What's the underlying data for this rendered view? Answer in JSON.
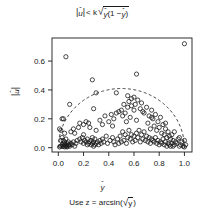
{
  "chart_data": {
    "type": "scatter",
    "title_parts": {
      "lhs_base": "u",
      "lhs_hat": "ˆ",
      "relation": "< k",
      "radical": "√",
      "inner_base_1": "y",
      "inner_hat_1": "ˆ",
      "inner_mid": "(1 −",
      "inner_base_2": "y",
      "inner_hat_2": "ˆ",
      "inner_close": ")"
    },
    "xlabel": "ŷ",
    "xlabel_base": "y",
    "xlabel_hat": "ˆ",
    "sublabel": "Use z = arcsin(√y̅)",
    "sublabel_parts": {
      "prefix": "Use z = arcsin(",
      "radical": "√",
      "arg": "y",
      "suffix": ")"
    },
    "ylabel": "|û|",
    "ylabel_base": "u",
    "ylabel_hat": "ˆ",
    "xticks": [
      "0.0",
      "0.2",
      "0.4",
      "0.6",
      "0.8",
      "1.0"
    ],
    "xtick_values": [
      0.0,
      0.2,
      0.4,
      0.6,
      0.8,
      1.0
    ],
    "yticks": [
      "0.0",
      "0.2",
      "0.4",
      "0.6"
    ],
    "ytick_values": [
      0.0,
      0.2,
      0.4,
      0.6
    ],
    "xlim": [
      -0.05,
      1.06
    ],
    "ylim": [
      -0.03,
      0.76
    ],
    "grid": false,
    "legend": false,
    "marker": "open-circle",
    "marker_color": "#1a1a1a",
    "marker_radius": 2.1,
    "boundary_curve": {
      "label": "k√(ŷ(1 − ŷ))",
      "style": "dashed",
      "k": 0.82,
      "peak_x": 0.5,
      "peak_y": 0.41
    },
    "x": [
      0.01,
      0.01,
      0.02,
      0.02,
      0.02,
      0.03,
      0.03,
      0.03,
      0.03,
      0.04,
      0.04,
      0.04,
      0.05,
      0.05,
      0.05,
      0.05,
      0.06,
      0.06,
      0.06,
      0.07,
      0.07,
      0.07,
      0.08,
      0.08,
      0.09,
      0.09,
      0.1,
      0.1,
      0.11,
      0.12,
      0.13,
      0.13,
      0.14,
      0.15,
      0.16,
      0.17,
      0.17,
      0.18,
      0.19,
      0.2,
      0.2,
      0.21,
      0.22,
      0.22,
      0.23,
      0.23,
      0.24,
      0.24,
      0.25,
      0.25,
      0.26,
      0.26,
      0.27,
      0.27,
      0.28,
      0.28,
      0.29,
      0.29,
      0.3,
      0.3,
      0.31,
      0.32,
      0.33,
      0.34,
      0.35,
      0.36,
      0.37,
      0.38,
      0.39,
      0.4,
      0.41,
      0.42,
      0.43,
      0.44,
      0.44,
      0.45,
      0.46,
      0.47,
      0.48,
      0.48,
      0.49,
      0.5,
      0.5,
      0.51,
      0.51,
      0.52,
      0.52,
      0.53,
      0.53,
      0.54,
      0.54,
      0.55,
      0.55,
      0.56,
      0.56,
      0.57,
      0.57,
      0.58,
      0.58,
      0.59,
      0.6,
      0.6,
      0.61,
      0.61,
      0.62,
      0.62,
      0.63,
      0.63,
      0.64,
      0.65,
      0.65,
      0.66,
      0.66,
      0.67,
      0.68,
      0.68,
      0.69,
      0.7,
      0.7,
      0.71,
      0.71,
      0.72,
      0.72,
      0.73,
      0.73,
      0.74,
      0.74,
      0.75,
      0.75,
      0.76,
      0.76,
      0.77,
      0.77,
      0.78,
      0.78,
      0.79,
      0.79,
      0.8,
      0.8,
      0.81,
      0.81,
      0.82,
      0.82,
      0.83,
      0.83,
      0.84,
      0.84,
      0.85,
      0.85,
      0.86,
      0.86,
      0.87,
      0.87,
      0.88,
      0.88,
      0.89,
      0.89,
      0.9,
      0.9,
      0.91,
      0.91,
      0.92,
      0.93,
      0.94,
      0.95,
      0.96,
      0.97,
      0.98,
      0.99,
      1.0,
      1.0,
      1.01,
      0.06,
      0.27,
      0.3,
      0.62,
      1.0,
      0.09,
      0.2,
      0.28,
      0.35,
      0.46,
      0.55,
      0.6,
      0.04,
      0.12,
      0.33,
      0.43,
      0.58,
      0.67,
      0.74,
      0.85,
      0.92,
      0.96
    ],
    "y": [
      0.005,
      0.13,
      0.01,
      0.05,
      0.12,
      0.01,
      0.02,
      0.07,
      0.2,
      0.01,
      0.03,
      0.05,
      0.005,
      0.02,
      0.04,
      0.1,
      0.01,
      0.02,
      0.06,
      0.005,
      0.01,
      0.03,
      0.02,
      0.04,
      0.01,
      0.02,
      0.03,
      0.11,
      0.02,
      0.04,
      0.01,
      0.1,
      0.03,
      0.05,
      0.14,
      0.06,
      0.17,
      0.04,
      0.07,
      0.03,
      0.16,
      0.05,
      0.04,
      0.18,
      0.02,
      0.06,
      0.03,
      0.17,
      0.04,
      0.14,
      0.02,
      0.05,
      0.03,
      0.07,
      0.01,
      0.04,
      0.02,
      0.06,
      0.03,
      0.12,
      0.04,
      0.02,
      0.05,
      0.03,
      0.06,
      0.04,
      0.22,
      0.08,
      0.03,
      0.18,
      0.05,
      0.23,
      0.07,
      0.04,
      0.2,
      0.02,
      0.24,
      0.06,
      0.03,
      0.25,
      0.08,
      0.04,
      0.26,
      0.11,
      0.22,
      0.05,
      0.3,
      0.09,
      0.24,
      0.03,
      0.18,
      0.07,
      0.28,
      0.12,
      0.32,
      0.06,
      0.21,
      0.09,
      0.34,
      0.04,
      0.08,
      0.26,
      0.05,
      0.3,
      0.1,
      0.19,
      0.07,
      0.33,
      0.12,
      0.04,
      0.27,
      0.09,
      0.31,
      0.06,
      0.11,
      0.24,
      0.05,
      0.08,
      0.28,
      0.04,
      0.17,
      0.07,
      0.22,
      0.03,
      0.13,
      0.06,
      0.26,
      0.05,
      0.2,
      0.04,
      0.15,
      0.07,
      0.23,
      0.03,
      0.12,
      0.05,
      0.18,
      0.02,
      0.14,
      0.04,
      0.21,
      0.03,
      0.1,
      0.06,
      0.16,
      0.02,
      0.09,
      0.04,
      0.13,
      0.01,
      0.07,
      0.03,
      0.11,
      0.02,
      0.08,
      0.01,
      0.06,
      0.03,
      0.09,
      0.01,
      0.05,
      0.02,
      0.04,
      0.03,
      0.06,
      0.01,
      0.02,
      0.04,
      0.01,
      0.005,
      0.05,
      0.02,
      0.63,
      0.47,
      0.38,
      0.51,
      0.72,
      0.3,
      0.09,
      0.27,
      0.16,
      0.38,
      0.36,
      0.35,
      0.2,
      0.13,
      0.19,
      0.15,
      0.29,
      0.25,
      0.21,
      0.17,
      0.11,
      0.07
    ]
  }
}
